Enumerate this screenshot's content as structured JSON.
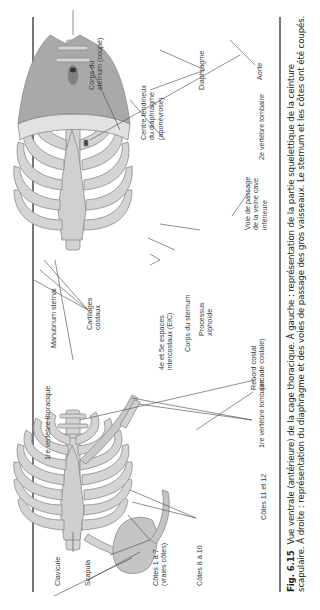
{
  "figure": {
    "number": "Fig. 6.15",
    "caption_line1": "Vue ventrale (antérieure) de la cage thoracique. À gauche : représentation de la partie squelettique de la ceinture",
    "caption_line2": "scapulaire. À droite : représentation du diaphragme et des voies de passage des gros vaisseaux. Le sternum et les côtes ont été coupés."
  },
  "left_panel": {
    "title": "Cage thoracique et ceinture scapulaire",
    "labels": {
      "vertebre_thoracique": "1re vertèbre thoracique",
      "clavicule": "Clavicule",
      "scapula": "Scapula",
      "cotes_1_7": "Côtes 1 à 7\n(vraies côtes)",
      "cotes_8_10": "Côtes 8 à 10",
      "cotes_11_12": "Côtes 11 et 12",
      "vertebre_lombaire": "1re vertèbre lombaire"
    }
  },
  "center_labels": {
    "manubrium": "Manubrium sternal",
    "cartilages": "Cartilages\ncostaux",
    "espaces": "4e et 5e espaces\nintercostaux (EIC)",
    "corps_sternum": "Corps du sternum",
    "processus": "Processus\nxiphoïde",
    "rebord": "Rebord costal\n(arcade costale)",
    "voie_passage": "Voie de passage\nde la veine cave\ninférieure"
  },
  "right_panel": {
    "title": "Diaphragme et gros vaisseaux",
    "labels": {
      "corps_sternum_coupe": "Corps du\nsternum (coupé)",
      "centre_tendineux": "Centre tendineux\ndu diaphragme\n(aponévrose)",
      "diaphragme": "Diaphragme",
      "aorte": "Aorte",
      "vertebre_lombaire_2": "2e vertèbre lombaire"
    }
  },
  "colors": {
    "bone": "#d4d4d4",
    "bone_stroke": "#8a8a8a",
    "muscle": "#a9a9a9",
    "rule": "#777777",
    "leader": "#444444"
  }
}
